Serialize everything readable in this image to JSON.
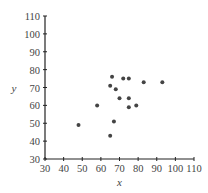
{
  "chart_data": {
    "type": "scatter",
    "title": "",
    "xlabel": "x",
    "ylabel": "y",
    "xlim": [
      30,
      110
    ],
    "ylim": [
      30,
      110
    ],
    "xticks": [
      30,
      40,
      50,
      60,
      70,
      80,
      90,
      100,
      110
    ],
    "yticks": [
      30,
      40,
      50,
      60,
      70,
      80,
      90,
      100,
      110
    ],
    "grid": false,
    "legend": null,
    "points": [
      {
        "x": 48,
        "y": 49
      },
      {
        "x": 58,
        "y": 60
      },
      {
        "x": 65,
        "y": 71
      },
      {
        "x": 66,
        "y": 76
      },
      {
        "x": 68,
        "y": 69
      },
      {
        "x": 70,
        "y": 64
      },
      {
        "x": 72,
        "y": 75
      },
      {
        "x": 75,
        "y": 75
      },
      {
        "x": 75,
        "y": 64
      },
      {
        "x": 75,
        "y": 59
      },
      {
        "x": 79,
        "y": 60
      },
      {
        "x": 67,
        "y": 51
      },
      {
        "x": 65,
        "y": 43
      },
      {
        "x": 83,
        "y": 73
      },
      {
        "x": 93,
        "y": 73
      }
    ],
    "colors": {
      "axis": "#222222",
      "point": "#444444",
      "text": "#444444"
    }
  }
}
